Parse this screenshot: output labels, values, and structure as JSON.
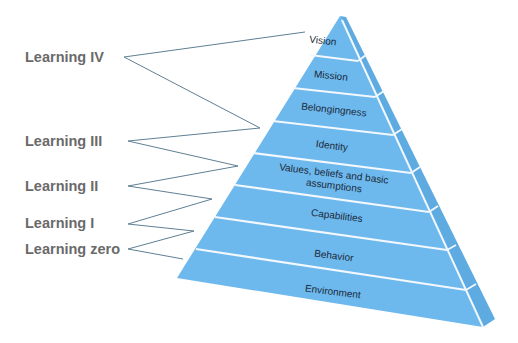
{
  "colors": {
    "front_face": "#6db8ec",
    "side_face": "#5eabe2",
    "divider": "#f2f8fd",
    "connector_line": "#5f7f93",
    "learning_label": "#6a6a6a",
    "layer_text": "#1c2a3a"
  },
  "learning_levels": [
    {
      "label": "Learning IV",
      "x": 25,
      "y": 49
    },
    {
      "label": "Learning III",
      "x": 25,
      "y": 133
    },
    {
      "label": "Learning II",
      "x": 25,
      "y": 178
    },
    {
      "label": "Learning I",
      "x": 25,
      "y": 215
    },
    {
      "label": "Learning zero",
      "x": 25,
      "y": 241
    }
  ],
  "pyramid_layers": [
    {
      "label": "Vision"
    },
    {
      "label": "Mission"
    },
    {
      "label": "Belongingness"
    },
    {
      "label": "Identity"
    },
    {
      "label": "Values, beliefs and basic",
      "label_line2": "assumptions"
    },
    {
      "label": "Capabilities"
    },
    {
      "label": "Behavior"
    },
    {
      "label": "Environment"
    }
  ]
}
